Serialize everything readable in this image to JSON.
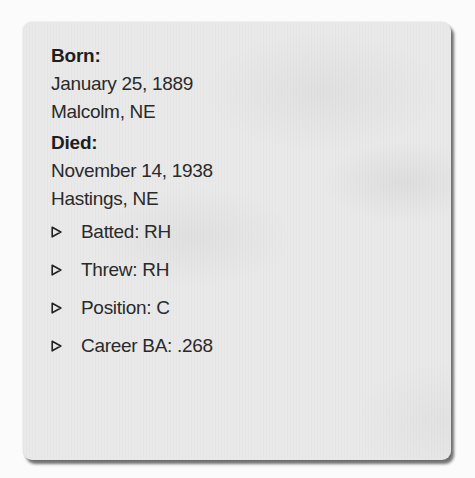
{
  "card": {
    "born": {
      "label": "Born:",
      "date": "January 25, 1889",
      "place": "Malcolm, NE"
    },
    "died": {
      "label": "Died:",
      "date": "November 14, 1938",
      "place": "Hastings, NE"
    },
    "stats": [
      {
        "icon": "triangle-right-icon",
        "text": "Batted: RH"
      },
      {
        "icon": "triangle-right-icon",
        "text": "Threw: RH"
      },
      {
        "icon": "triangle-right-icon",
        "text": "Position: C"
      },
      {
        "icon": "triangle-right-icon",
        "text": "Career BA: .268"
      }
    ]
  }
}
